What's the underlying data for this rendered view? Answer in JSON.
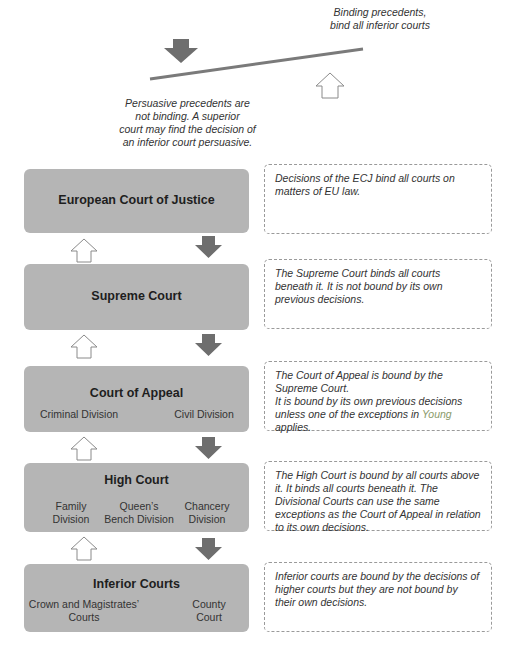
{
  "legend": {
    "binding_note_line1": "Binding precedents,",
    "binding_note_line2": "bind all inferior courts",
    "persuasive_note_line1": "Persuasive precedents are",
    "persuasive_note_line2": "not binding. A superior",
    "persuasive_note_line3": "court may find the decision of",
    "persuasive_note_line4": "an inferior court persuasive.",
    "binding_arrow_icon": "solid-down-arrow",
    "persuasive_arrow_icon": "outline-up-arrow"
  },
  "colors": {
    "court_box": "#b5b5b5",
    "binding_arrow": "#6e6e6e",
    "persuasive_arrow_stroke": "#8a8a8a",
    "dashed_border": "#9a9a9a",
    "young_highlight": "#8a9a6a"
  },
  "courts": [
    {
      "title": "European Court of Justice",
      "divisions": [],
      "description": "Decisions of the ECJ bind all courts on matters of EU law."
    },
    {
      "title": "Supreme Court",
      "divisions": [],
      "description": "The Supreme Court binds all courts beneath it. It is not bound by its own previous decisions."
    },
    {
      "title": "Court of Appeal",
      "divisions": [
        "Criminal Division",
        "Civil Division"
      ],
      "description_line1": "The Court of Appeal is bound by the Supreme Court.",
      "description_line2_pre": "It is bound by its own previous decisions unless one of the exceptions in ",
      "description_link": "Young",
      "description_line2_post": " applies."
    },
    {
      "title": "High Court",
      "divisions": [
        "Family Division",
        "Queen’s Bench Division",
        "Chancery Division"
      ],
      "description": "The High Court is bound by all courts above it. It binds all courts beneath it. The Divisional Courts can use the same exceptions as the Court of Appeal in relation to its own decisions."
    },
    {
      "title": "Inferior Courts",
      "divisions": [
        "Crown and Magistrates’ Courts",
        "County Court"
      ],
      "description": "Inferior courts are bound by the decisions of higher courts but they are not bound by their own decisions."
    }
  ]
}
